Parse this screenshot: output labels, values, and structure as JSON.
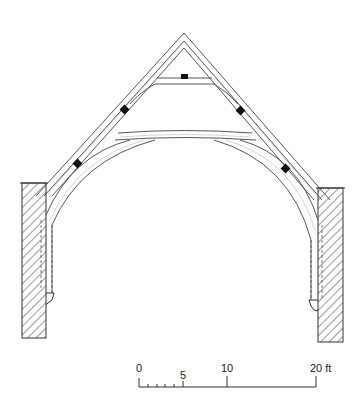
{
  "diagram": {
    "scale_bar": {
      "labels": [
        "0",
        "5",
        "10",
        "20 ft"
      ],
      "values": [
        0,
        5,
        10,
        20
      ],
      "unit": "ft",
      "minor_ticks": [
        1,
        2,
        3,
        4
      ]
    },
    "colors": {
      "line": "#444444",
      "block": "#111111",
      "background": "#ffffff"
    }
  }
}
